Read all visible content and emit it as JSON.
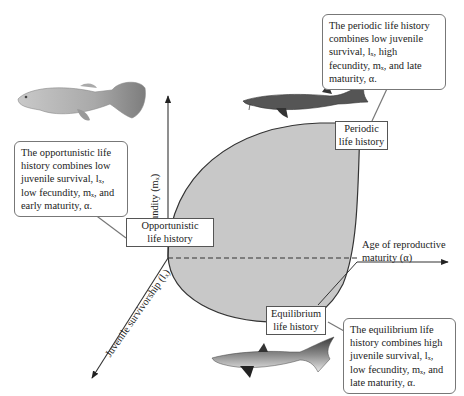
{
  "diagram": {
    "type": "3d-axis life history triangle",
    "colors": {
      "region_fill": "#c8c8c8",
      "axis": "#333333",
      "box_border": "#555555",
      "callout_border": "#777777"
    },
    "axes": {
      "y": {
        "label": "Fecundity (mₓ)"
      },
      "x": {
        "label_line1": "Age of reproductive",
        "label_line2": "maturity (α)"
      },
      "z": {
        "label": "Juvenile survivorship (lₓ)"
      }
    },
    "vertices": {
      "opportunistic": {
        "line1": "Opportunistic",
        "line2": "life history"
      },
      "periodic": {
        "line1": "Periodic",
        "line2": "life history"
      },
      "equilibrium": {
        "line1": "Equilibrium",
        "line2": "life history"
      }
    },
    "callouts": {
      "periodic": "The periodic life history combines low juvenile survival, lₓ, high fecundity, mₓ, and late maturity, α.",
      "opportunistic": "The opportunistic life history combines low juvenile survival, lₓ, low fecundity, mₓ, and early maturity, α.",
      "equilibrium": "The equilibrium life history combines high juvenile survival, lₓ, low fecundity, mₓ, and late maturity, α."
    },
    "images": {
      "opportunistic": "guppy-fish",
      "periodic": "sturgeon-fish",
      "equilibrium": "shark"
    }
  }
}
